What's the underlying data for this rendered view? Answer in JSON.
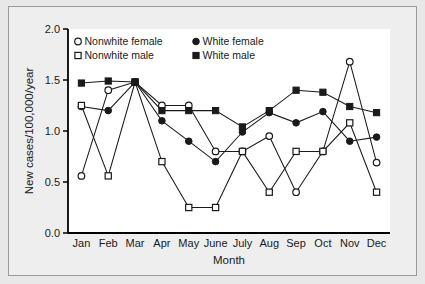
{
  "chart_data": {
    "type": "line",
    "title": "",
    "xlabel": "Month",
    "ylabel": "New cases/100,000/year",
    "categories": [
      "Jan",
      "Feb",
      "Mar",
      "Apr",
      "May",
      "June",
      "July",
      "Aug",
      "Sep",
      "Oct",
      "Nov",
      "Dec"
    ],
    "ylim": [
      0.0,
      2.0
    ],
    "ytick_labels": [
      "0.0",
      "0.5",
      "1.0",
      "1.5",
      "2.0"
    ],
    "ytick_values": [
      0.0,
      0.5,
      1.0,
      1.5,
      2.0
    ],
    "grid": false,
    "legend_position": "top-left-inside",
    "series": [
      {
        "name": "Nonwhite female",
        "marker": "open-circle",
        "values": [
          0.56,
          1.4,
          1.48,
          1.25,
          1.25,
          0.8,
          0.8,
          0.95,
          0.4,
          0.8,
          1.68,
          0.69
        ]
      },
      {
        "name": "White female",
        "marker": "filled-circle",
        "values": [
          1.24,
          1.2,
          1.48,
          1.1,
          0.9,
          0.7,
          0.99,
          1.18,
          1.08,
          1.19,
          0.9,
          0.94
        ]
      },
      {
        "name": "Nonwhite male",
        "marker": "open-square",
        "values": [
          1.25,
          0.56,
          1.48,
          0.7,
          0.25,
          0.25,
          0.8,
          0.4,
          0.8,
          0.8,
          1.08,
          0.4
        ]
      },
      {
        "name": "White male",
        "marker": "filled-square",
        "values": [
          1.47,
          1.49,
          1.48,
          1.2,
          1.2,
          1.2,
          1.04,
          1.2,
          1.4,
          1.38,
          1.24,
          1.18
        ]
      }
    ]
  },
  "colors": {
    "line": "#1a1a1a",
    "axis": "#000000",
    "plot_background": "#ffffff",
    "figure_background": "#e8e8e8"
  }
}
